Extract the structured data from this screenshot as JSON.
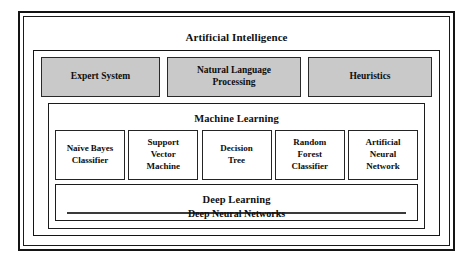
{
  "diagram": {
    "type": "nested-hierarchy",
    "root": {
      "title": "Artificial Intelligence",
      "fill": "#ffffff"
    },
    "techniques": {
      "fill": "#c9c9c9",
      "items": [
        {
          "label": "Expert System"
        },
        {
          "label": "Natural Language\nProcessing"
        },
        {
          "label": "Heuristics"
        }
      ]
    },
    "machine_learning": {
      "title": "Machine Learning",
      "fill": "#ffffff",
      "algorithms": [
        {
          "label": "Naïve Bayes\nClassifier"
        },
        {
          "label": "Support\nVector\nMachine"
        },
        {
          "label": "Decision\nTree"
        },
        {
          "label": "Random\nForest\nClassifier"
        },
        {
          "label": "Artificial\nNeural\nNetwork"
        }
      ]
    },
    "deep_learning": {
      "title": "Deep Learning",
      "fill": "#ffffff",
      "inner": {
        "label": "Deep Neural Networks",
        "fill": "#e2e2e2"
      }
    },
    "colors": {
      "border": "#141414",
      "technique_fill": "#c9c9c9",
      "dnn_fill": "#e2e2e2",
      "background": "#ffffff",
      "text": "#0e0e0e"
    }
  }
}
